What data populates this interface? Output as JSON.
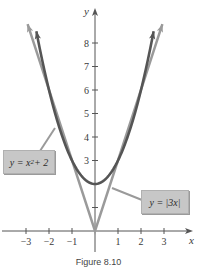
{
  "chart_data": {
    "type": "line",
    "title": "",
    "xlabel": "x",
    "ylabel": "y",
    "xlim": [
      -3.8,
      4.2
    ],
    "ylim": [
      -0.9,
      9.5
    ],
    "x_ticks": [
      -3,
      -2,
      -1,
      1,
      2,
      3
    ],
    "x_tick_labels": [
      "−3",
      "−2",
      "−1",
      "1",
      "2",
      "3"
    ],
    "y_ticks": [
      1,
      2,
      3,
      4,
      5,
      6,
      7,
      8
    ],
    "y_tick_labels": [
      "",
      "",
      "3",
      "4",
      "5",
      "6",
      "7",
      "8"
    ],
    "grid": false,
    "series": [
      {
        "name": "y = x^2 + 2",
        "label": "y = x² + 2",
        "color": "#555555",
        "x": [
          -2.65,
          -2,
          -1.5,
          -1,
          -0.5,
          0,
          0.5,
          1,
          1.5,
          2,
          2.65
        ],
        "values": [
          9.02,
          6,
          4.25,
          3,
          2.25,
          2,
          2.25,
          3,
          4.25,
          6,
          9.02
        ]
      },
      {
        "name": "y = |3x|",
        "label": "y = |3x|",
        "color": "#9a9a9a",
        "x": [
          -3.0,
          -2,
          -1,
          0,
          1,
          2,
          3.0
        ],
        "values": [
          9,
          6,
          3,
          0,
          3,
          6,
          9
        ]
      }
    ],
    "annotations": [
      {
        "text": "y = x² + 2",
        "target": "parabola",
        "position": "left"
      },
      {
        "text": "y = |3x|",
        "target": "absolute value",
        "position": "right"
      }
    ]
  },
  "labels": {
    "x_axis": "x",
    "y_axis": "y",
    "callout_parabola": "y = x² + 2",
    "callout_abs": "y = |3x|",
    "caption": "Figure 8.10"
  },
  "colors": {
    "parabola": "#555555",
    "abs": "#9a9a9a",
    "axis": "#555555",
    "callout_bg": "#c7c7c7"
  }
}
